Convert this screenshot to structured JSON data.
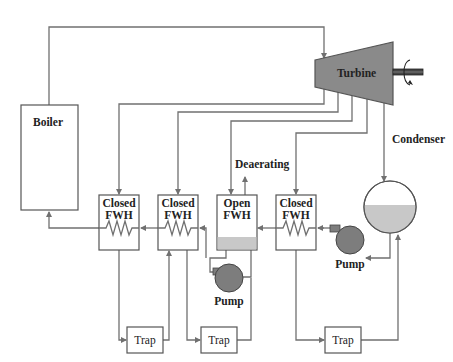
{
  "diagram": {
    "colors": {
      "line": "#707070",
      "box_stroke": "#555555",
      "turbine_fill": "#8a8a8a",
      "pump_fill": "#7d7d7d",
      "liquid_fill": "#c8c8c8",
      "text": "#222222"
    },
    "components": {
      "boiler": {
        "label": "Boiler"
      },
      "turbine": {
        "label": "Turbine"
      },
      "condenser": {
        "label": "Condenser"
      },
      "deaerating": {
        "label": "Deaerating"
      },
      "fwh1": {
        "line1": "Closed",
        "line2": "FWH"
      },
      "fwh2": {
        "line1": "Closed",
        "line2": "FWH"
      },
      "fwh_open": {
        "line1": "Open",
        "line2": "FWH"
      },
      "fwh3": {
        "line1": "Closed",
        "line2": "FWH"
      },
      "pump1": {
        "label": "Pump"
      },
      "pump2": {
        "label": "Pump"
      },
      "trap1": {
        "label": "Trap"
      },
      "trap2": {
        "label": "Trap"
      },
      "trap3": {
        "label": "Trap"
      }
    }
  }
}
